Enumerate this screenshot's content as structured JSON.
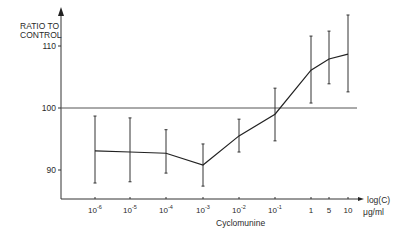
{
  "chart_data": {
    "type": "line",
    "title": "",
    "xlabel": "Cyclomunine",
    "ylabel": "RATIO TO CONTROL",
    "x_axis_unit_line1": "log(C)",
    "x_axis_unit_line2": "μg/ml",
    "categories": [
      "10^-6",
      "10^-5",
      "10^-4",
      "10^-3",
      "10^-2",
      "10^-1",
      "1",
      "5",
      "10"
    ],
    "x_tick_labels": [
      {
        "base": "10",
        "exp": "-6"
      },
      {
        "base": "10",
        "exp": "-5"
      },
      {
        "base": "10",
        "exp": "-4"
      },
      {
        "base": "10",
        "exp": "-3"
      },
      {
        "base": "10",
        "exp": "-2"
      },
      {
        "base": "10",
        "exp": "-1"
      },
      {
        "base": "1",
        "exp": ""
      },
      {
        "base": "5",
        "exp": ""
      },
      {
        "base": "10",
        "exp": ""
      }
    ],
    "series": [
      {
        "name": "Cyclomunine",
        "values": [
          93.1,
          92.9,
          92.7,
          90.8,
          95.5,
          99.0,
          106.1,
          107.9,
          108.7
        ],
        "error_upper": [
          98.7,
          98.4,
          96.5,
          94.2,
          98.2,
          103.2,
          111.6,
          112.4,
          115.0
        ],
        "error_lower": [
          87.9,
          88.1,
          89.5,
          87.4,
          92.9,
          94.7,
          100.8,
          103.9,
          102.6
        ]
      }
    ],
    "reference_line": 100,
    "y_ticks": [
      90,
      100,
      110
    ],
    "ylim": [
      84,
      120
    ],
    "grid": false,
    "legend": "none"
  }
}
